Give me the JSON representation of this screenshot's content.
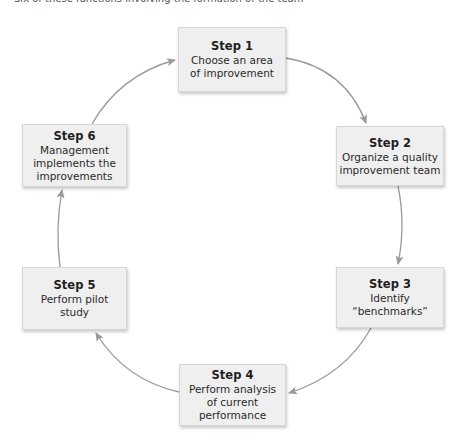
{
  "caption": "Six of these functions involving the formation of the team",
  "colors": {
    "box_fill": "#efefef",
    "box_border": "#d6d6d6",
    "arrow": "#9a9a9a",
    "text": "#222222"
  },
  "steps": [
    {
      "title": "Step 1",
      "lines": [
        "Choose an area",
        "of improvement"
      ]
    },
    {
      "title": "Step 2",
      "lines": [
        "Organize a quality",
        "improvement team"
      ]
    },
    {
      "title": "Step 3",
      "lines": [
        "Identify",
        "“benchmarks”"
      ]
    },
    {
      "title": "Step 4",
      "lines": [
        "Perform analysis",
        "of current",
        "performance"
      ]
    },
    {
      "title": "Step 5",
      "lines": [
        "Perform pilot",
        "study"
      ]
    },
    {
      "title": "Step 6",
      "lines": [
        "Management",
        "implements the",
        "improvements"
      ]
    }
  ],
  "flow": [
    "Step 1 → Step 2",
    "Step 2 → Step 3",
    "Step 3 → Step 4",
    "Step 4 → Step 5",
    "Step 5 → Step 6",
    "Step 6 → Step 1"
  ]
}
